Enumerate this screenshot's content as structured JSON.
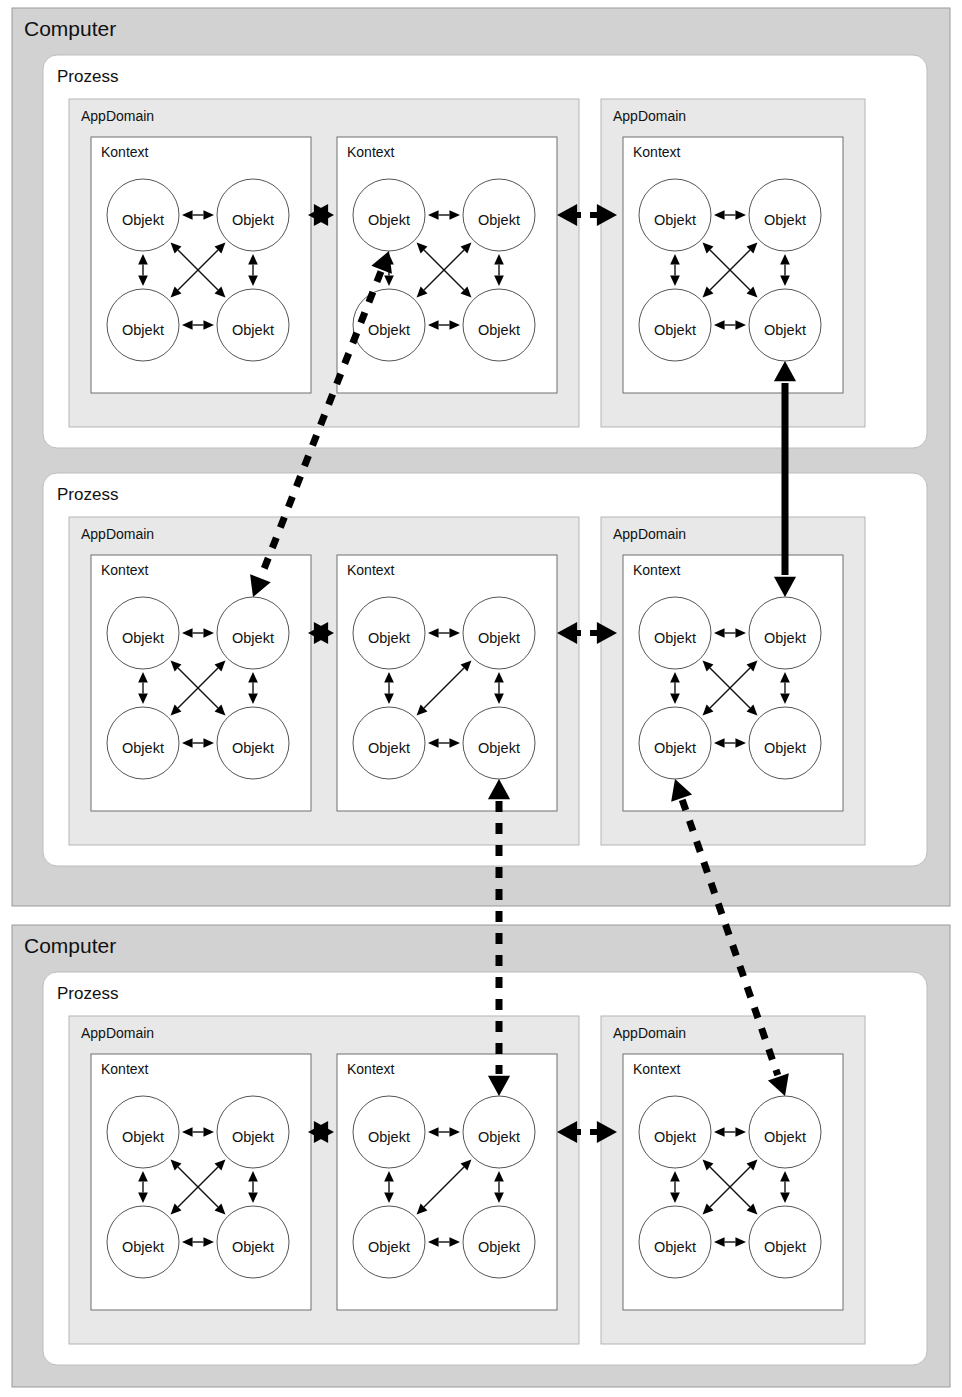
{
  "diagram": {
    "labels": {
      "computer": "Computer",
      "prozess": "Prozess",
      "appdomain": "AppDomain",
      "kontext": "Kontext",
      "objekt": "Objekt"
    },
    "colors": {
      "computer_fill": "#d2d2d2",
      "prozess_fill": "#ffffff",
      "appdomain_fill": "#e8e8e8",
      "kontext_fill": "#ffffff",
      "object_fill": "#ffffff",
      "line": "#000000"
    },
    "computers": [
      {
        "name": "Computer",
        "processes": [
          {
            "name": "Prozess",
            "appdomains": [
              {
                "name": "AppDomain",
                "contexts": [
                  {
                    "name": "Kontext",
                    "objects": [
                      "Objekt",
                      "Objekt",
                      "Objekt",
                      "Objekt"
                    ]
                  },
                  {
                    "name": "Kontext",
                    "objects": [
                      "Objekt",
                      "Objekt",
                      "Objekt",
                      "Objekt"
                    ]
                  }
                ]
              },
              {
                "name": "AppDomain",
                "contexts": [
                  {
                    "name": "Kontext",
                    "objects": [
                      "Objekt",
                      "Objekt",
                      "Objekt",
                      "Objekt"
                    ]
                  }
                ]
              }
            ]
          },
          {
            "name": "Prozess",
            "appdomains": [
              {
                "name": "AppDomain",
                "contexts": [
                  {
                    "name": "Kontext",
                    "objects": [
                      "Objekt",
                      "Objekt",
                      "Objekt",
                      "Objekt"
                    ]
                  },
                  {
                    "name": "Kontext",
                    "objects": [
                      "Objekt",
                      "Objekt",
                      "Objekt",
                      "Objekt"
                    ]
                  }
                ]
              },
              {
                "name": "AppDomain",
                "contexts": [
                  {
                    "name": "Kontext",
                    "objects": [
                      "Objekt",
                      "Objekt",
                      "Objekt",
                      "Objekt"
                    ]
                  }
                ]
              }
            ]
          }
        ]
      },
      {
        "name": "Computer",
        "processes": [
          {
            "name": "Prozess",
            "appdomains": [
              {
                "name": "AppDomain",
                "contexts": [
                  {
                    "name": "Kontext",
                    "objects": [
                      "Objekt",
                      "Objekt",
                      "Objekt",
                      "Objekt"
                    ]
                  },
                  {
                    "name": "Kontext",
                    "objects": [
                      "Objekt",
                      "Objekt",
                      "Objekt",
                      "Objekt"
                    ]
                  }
                ]
              },
              {
                "name": "AppDomain",
                "contexts": [
                  {
                    "name": "Kontext",
                    "objects": [
                      "Objekt",
                      "Objekt",
                      "Objekt",
                      "Objekt"
                    ]
                  }
                ]
              }
            ]
          }
        ]
      }
    ],
    "connector_kinds": {
      "intra_context": "thin double arrow between Objekt nodes inside one Kontext",
      "cross_context": "thick solid double arrowhead pair between Kontext boundaries",
      "cross_appdomain": "thick arrowheads joined by short dashes across AppDomain boundaries",
      "cross_process": "thick dashed double arrow between Prozess blocks",
      "cross_computer": "thick dashed double arrow between Computer blocks",
      "remote_solid": "thick solid double arrow between AppDomains of two Prozesse"
    }
  }
}
